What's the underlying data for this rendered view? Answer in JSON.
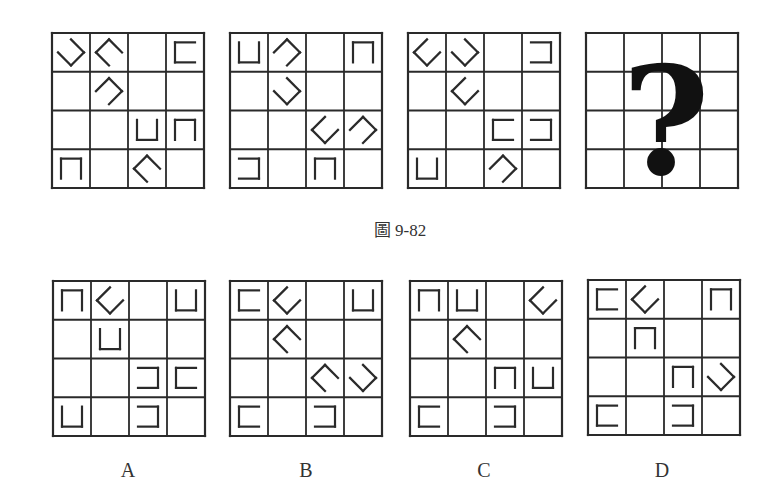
{
  "figure": {
    "caption": "圖 9-82",
    "question_mark": "?",
    "stimulus": [
      {
        "id": "fig1",
        "cells": [
          [
            "open-ul",
            "open-dr",
            "",
            "C"
          ],
          [
            "",
            "open-dl",
            "",
            ""
          ],
          [
            "",
            "",
            "U",
            "N"
          ],
          [
            "N",
            "",
            "open-dr",
            ""
          ]
        ]
      },
      {
        "id": "fig2",
        "cells": [
          [
            "U",
            "open-dl",
            "",
            "N"
          ],
          [
            "",
            "open-ul",
            "",
            ""
          ],
          [
            "",
            "",
            "open-ur",
            "open-dl"
          ],
          [
            "D",
            "",
            "N",
            ""
          ]
        ]
      },
      {
        "id": "fig3",
        "cells": [
          [
            "open-ur",
            "open-ul",
            "",
            "D"
          ],
          [
            "",
            "open-ur",
            "",
            ""
          ],
          [
            "",
            "",
            "C",
            "D"
          ],
          [
            "U",
            "",
            "open-dl",
            ""
          ]
        ]
      },
      {
        "id": "fig4",
        "cells": "question"
      }
    ],
    "options": [
      {
        "label": "A",
        "cells": [
          [
            "N",
            "open-ur",
            "",
            "U"
          ],
          [
            "",
            "U",
            "",
            ""
          ],
          [
            "",
            "",
            "D",
            "C"
          ],
          [
            "U",
            "",
            "D",
            ""
          ]
        ]
      },
      {
        "label": "B",
        "cells": [
          [
            "C",
            "open-ur",
            "",
            "U"
          ],
          [
            "",
            "open-dr",
            "",
            ""
          ],
          [
            "",
            "",
            "open-dr",
            "open-ul"
          ],
          [
            "C",
            "",
            "D",
            ""
          ]
        ]
      },
      {
        "label": "C",
        "cells": [
          [
            "N",
            "U",
            "",
            "open-ur"
          ],
          [
            "",
            "open-dr",
            "",
            ""
          ],
          [
            "",
            "",
            "N",
            "U"
          ],
          [
            "C",
            "",
            "D",
            ""
          ]
        ]
      },
      {
        "label": "D",
        "cells": [
          [
            "C",
            "open-ur",
            "",
            "N"
          ],
          [
            "",
            "N",
            "",
            ""
          ],
          [
            "",
            "",
            "N",
            "open-ul"
          ],
          [
            "C",
            "",
            "D",
            ""
          ]
        ]
      }
    ],
    "glyph_legend": {
      "U": "bracket open top",
      "N": "bracket open bottom",
      "C": "bracket open right",
      "D": "bracket open left",
      "open-ul": "rotated bracket open upper-left",
      "open-ur": "rotated bracket open upper-right",
      "open-dl": "rotated bracket open lower-left",
      "open-dr": "rotated bracket open lower-right"
    },
    "colors": {
      "line": "#2a2a2a",
      "background": "#ffffff"
    }
  }
}
